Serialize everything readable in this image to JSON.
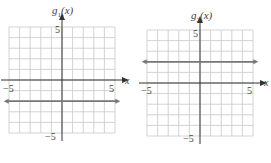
{
  "chart_data": [
    {
      "type": "line",
      "title": "g1(x)",
      "title_base": "g",
      "title_sub": "1",
      "title_arg": "(x)",
      "xlabel": "x",
      "ylabel": "g1(x)",
      "xlim": [
        -5,
        5
      ],
      "ylim": [
        -5,
        5
      ],
      "grid": true,
      "x_tick_labels": [
        "−5",
        "5"
      ],
      "y_tick_labels": [
        "5",
        "−5"
      ],
      "series": [
        {
          "name": "g1(x) = -2",
          "x": [
            -5.5,
            5.5
          ],
          "y": [
            -2,
            -2
          ],
          "style": "horizontal line with arrows both ends"
        }
      ]
    },
    {
      "type": "line",
      "title": "g2(x)",
      "title_base": "g",
      "title_sub": "2",
      "title_arg": "(x)",
      "xlabel": "x",
      "ylabel": "g2(x)",
      "xlim": [
        -5,
        5
      ],
      "ylim": [
        -5,
        5
      ],
      "grid": true,
      "x_tick_labels": [
        "−5",
        "5"
      ],
      "y_tick_labels": [
        "5",
        "−5"
      ],
      "series": [
        {
          "name": "g2(x) = 2",
          "x": [
            -5.5,
            5.5
          ],
          "y": [
            2,
            2
          ],
          "style": "horizontal line with arrows both ends"
        }
      ]
    }
  ],
  "colors": {
    "grid": "#c8c8c8",
    "axis": "#333333",
    "function_line": "#777777",
    "text": "#444444"
  }
}
